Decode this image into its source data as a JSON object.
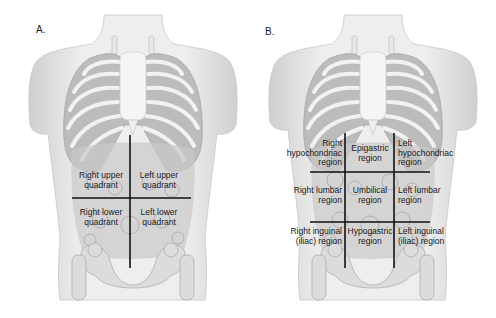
{
  "figure": {
    "panels": [
      {
        "letter": "A.",
        "type": "four-quadrant",
        "regions": [
          {
            "label": "Right upper quadrant",
            "line1": "Right upper",
            "line2": "quadrant"
          },
          {
            "label": "Left upper quadrant",
            "line1": "Left upper",
            "line2": "quadrant"
          },
          {
            "label": "Right lower quadrant",
            "line1": "Right lower",
            "line2": "quadrant"
          },
          {
            "label": "Left lower quadrant",
            "line1": "Left lower",
            "line2": "quadrant"
          }
        ]
      },
      {
        "letter": "B.",
        "type": "nine-region",
        "regions": [
          {
            "label": "Right hypochondriac region",
            "line1": "Right",
            "line2": "hypochondriac",
            "line3": "region"
          },
          {
            "label": "Epigastric region",
            "line1": "Epigastric",
            "line2": "region"
          },
          {
            "label": "Left hypochondriac region",
            "line1": "Left",
            "line2": "hypochondriac",
            "line3": "region"
          },
          {
            "label": "Right lumbar region",
            "line1": "Right lumbar",
            "line2": "region"
          },
          {
            "label": "Umbilical region",
            "line1": "Umbilical",
            "line2": "region"
          },
          {
            "label": "Left lumbar region",
            "line1": "Left lumbar",
            "line2": "region"
          },
          {
            "label": "Right inguinal (iliac) region",
            "line1": "Right inguinal",
            "line2": "(iliac) region"
          },
          {
            "label": "Hypogastric region",
            "line1": "Hypogastric",
            "line2": "region"
          },
          {
            "label": "Left inguinal (iliac) region",
            "line1": "Left inguinal",
            "line2": "(iliac) region"
          }
        ]
      }
    ]
  },
  "colors": {
    "skin": "#e6e6e6",
    "ribs": "#f4f4f4",
    "organs": "#bdbdbd",
    "lines": "#111111"
  }
}
